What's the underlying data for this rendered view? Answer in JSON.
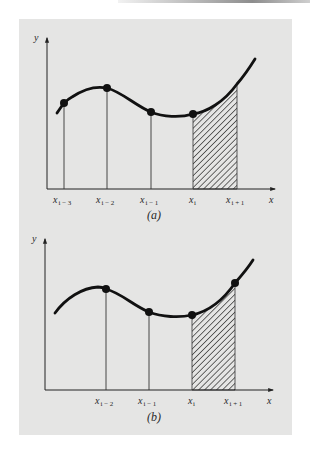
{
  "figure": {
    "background_color": "#e5e5e4",
    "curve_color": "#111111",
    "hatch_color": "#222222",
    "panels": [
      {
        "id": "a",
        "caption": "(a)",
        "y_axis_label": "y",
        "x_axis_label": "x",
        "x_ticks": [
          {
            "base": "x",
            "sub": "i − 3",
            "x": 64
          },
          {
            "base": "x",
            "sub": "i − 2",
            "x": 107
          },
          {
            "base": "x",
            "sub": "i − 1",
            "x": 151
          },
          {
            "base": "x",
            "sub": "i",
            "x": 193
          },
          {
            "base": "x",
            "sub": "i + 1",
            "x": 237
          }
        ],
        "points": [
          {
            "label": "x_{i-3}",
            "x": 64,
            "y": 103
          },
          {
            "label": "x_{i-2}",
            "x": 107,
            "y": 88
          },
          {
            "label": "x_{i-1}",
            "x": 151,
            "y": 112
          },
          {
            "label": "x_i",
            "x": 193,
            "y": 114
          }
        ],
        "shaded_interval": [
          "x_i",
          "x_{i+1}"
        ]
      },
      {
        "id": "b",
        "caption": "(b)",
        "y_axis_label": "y",
        "x_axis_label": "x",
        "x_ticks": [
          {
            "base": "x",
            "sub": "i − 2",
            "x": 106
          },
          {
            "base": "x",
            "sub": "i − 1",
            "x": 149
          },
          {
            "base": "x",
            "sub": "i",
            "x": 192
          },
          {
            "base": "x",
            "sub": "i + 1",
            "x": 235
          }
        ],
        "points": [
          {
            "label": "x_{i-2}",
            "x": 106,
            "y": 289
          },
          {
            "label": "x_{i-1}",
            "x": 149,
            "y": 312
          },
          {
            "label": "x_i",
            "x": 192,
            "y": 315
          },
          {
            "label": "x_{i+1}",
            "x": 235,
            "y": 283
          }
        ],
        "shaded_interval": [
          "x_i",
          "x_{i+1}"
        ]
      }
    ]
  }
}
